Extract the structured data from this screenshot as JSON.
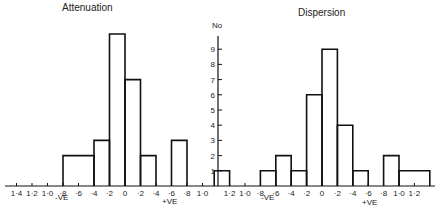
{
  "chart_data": [
    {
      "type": "bar",
      "title": "Attenuation",
      "ylabel": "No",
      "xlabel": "",
      "negative_label": "-VE",
      "positive_label": "+VE",
      "tick_labels": [
        "1·4",
        "1·2",
        "1·0",
        "·8",
        "·6",
        "·4",
        "·2",
        "0",
        "·2",
        "·4",
        "·6",
        "·8",
        "1·0"
      ],
      "tick_values": [
        -1.4,
        -1.2,
        -1.0,
        -0.8,
        -0.6,
        -0.4,
        -0.2,
        0,
        0.2,
        0.4,
        0.6,
        0.8,
        1.0
      ],
      "bins": [
        {
          "from": -0.8,
          "to": -0.4,
          "count": 2
        },
        {
          "from": -0.4,
          "to": -0.2,
          "count": 3
        },
        {
          "from": -0.2,
          "to": 0.0,
          "count": 10
        },
        {
          "from": 0.0,
          "to": 0.2,
          "count": 7
        },
        {
          "from": 0.2,
          "to": 0.4,
          "count": 2
        },
        {
          "from": 0.6,
          "to": 0.8,
          "count": 3
        }
      ],
      "ylim": [
        0,
        10
      ]
    },
    {
      "type": "bar",
      "title": "Dispersion",
      "ylabel": "No",
      "xlabel": "",
      "negative_label": "-VE",
      "positive_label": "+VE",
      "tick_labels": [
        "1·2",
        "1·0",
        "·8",
        "·6",
        "·4",
        "·2",
        "0",
        "·2",
        "·4",
        "·6",
        "·8",
        "1·0",
        "1·2"
      ],
      "tick_values": [
        -1.2,
        -1.0,
        -0.8,
        -0.6,
        -0.4,
        -0.2,
        0,
        0.2,
        0.4,
        0.6,
        0.8,
        1.0,
        1.2
      ],
      "bins": [
        {
          "from": -1.4,
          "to": -1.2,
          "count": 1
        },
        {
          "from": -0.8,
          "to": -0.6,
          "count": 1
        },
        {
          "from": -0.6,
          "to": -0.4,
          "count": 2
        },
        {
          "from": -0.4,
          "to": -0.2,
          "count": 1
        },
        {
          "from": -0.2,
          "to": 0.0,
          "count": 6
        },
        {
          "from": 0.0,
          "to": 0.2,
          "count": 9
        },
        {
          "from": 0.2,
          "to": 0.4,
          "count": 4
        },
        {
          "from": 0.4,
          "to": 0.6,
          "count": 1
        },
        {
          "from": 0.8,
          "to": 1.0,
          "count": 2
        },
        {
          "from": 1.0,
          "to": 1.4,
          "count": 1
        }
      ],
      "ylim": [
        0,
        10
      ]
    }
  ],
  "yaxis": {
    "label": "No",
    "ticks": [
      "1",
      "2",
      "3",
      "4",
      "5",
      "6",
      "7",
      "8",
      "9"
    ]
  }
}
